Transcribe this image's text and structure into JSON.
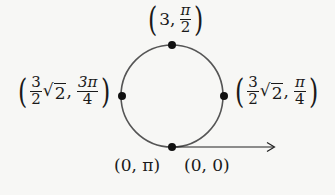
{
  "diagram": {
    "circle": {
      "cx": 172,
      "cy": 96,
      "r": 51,
      "stroke": "#555555"
    },
    "arrow": {
      "x1": 172,
      "y1": 147,
      "x2": 275,
      "y2": 147,
      "color": "#222222"
    },
    "points": [
      {
        "id": "top",
        "x": 172,
        "y": 45
      },
      {
        "id": "left",
        "x": 122,
        "y": 96
      },
      {
        "id": "right",
        "x": 224,
        "y": 96
      },
      {
        "id": "bottom",
        "x": 172,
        "y": 147
      }
    ],
    "labels": {
      "top": {
        "first": "3",
        "frac_num": "π",
        "frac_den": "2"
      },
      "left": {
        "coef_num": "3",
        "coef_den": "2",
        "radical": "2",
        "frac_num": "3π",
        "frac_den": "4"
      },
      "right": {
        "coef_num": "3",
        "coef_den": "2",
        "radical": "2",
        "frac_num": "π",
        "frac_den": "4"
      },
      "bottom_left": {
        "text": "(0, π)"
      },
      "bottom_right": {
        "text": "(0, 0)"
      }
    },
    "separator": ",",
    "sqrt_symbol": "√",
    "open_paren": "(",
    "close_paren": ")"
  }
}
